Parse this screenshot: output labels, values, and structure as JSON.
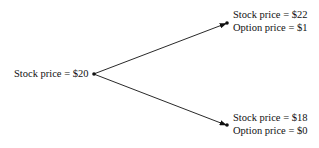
{
  "diagram": {
    "root": {
      "label": "Stock price = $20"
    },
    "up": {
      "stock": "Stock price = $22",
      "option": "Option price = $1"
    },
    "down": {
      "stock": "Stock price = $18",
      "option": "Option price = $0"
    }
  }
}
